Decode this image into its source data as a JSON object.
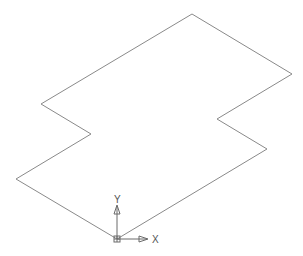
{
  "viewport": {
    "width": 303,
    "height": 256,
    "background": "#ffffff",
    "line_color": "#8a8a8a",
    "icon_color": "#6a6a6a"
  },
  "drawing": {
    "shape": "closed-polyline",
    "points": [
      [
        192,
        14
      ],
      [
        292,
        74
      ],
      [
        217,
        119
      ],
      [
        267,
        149
      ],
      [
        117,
        239
      ],
      [
        16,
        179
      ],
      [
        91,
        134
      ],
      [
        41,
        104
      ]
    ]
  },
  "ucs_icon": {
    "origin": [
      117,
      239
    ],
    "x_label": "X",
    "y_label": "Y"
  }
}
